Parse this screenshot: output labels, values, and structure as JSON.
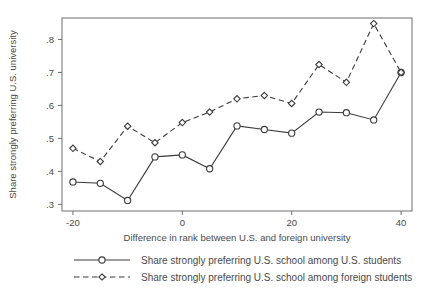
{
  "chart_data": {
    "type": "line",
    "title": "",
    "xlabel": "Difference in rank between U.S. and foreign university",
    "ylabel": "Share strongly preferring U.S. university",
    "xlim": [
      -22,
      42
    ],
    "ylim": [
      0.28,
      0.865
    ],
    "x": [
      -20,
      -15,
      -10,
      -5,
      0,
      5,
      10,
      15,
      20,
      25,
      30,
      35,
      40
    ],
    "xticks": [
      -20,
      0,
      20,
      40
    ],
    "xticklabels": [
      "-20",
      "0",
      "20",
      "40"
    ],
    "yticks": [
      0.3,
      0.4,
      0.5,
      0.6,
      0.7,
      0.8
    ],
    "yticklabels": [
      ".3",
      ".4",
      ".5",
      ".6",
      ".7",
      ".8"
    ],
    "grid": false,
    "legend_position": "below",
    "series": [
      {
        "name": "Share strongly preferring U.S. school among U.S. students",
        "marker": "circle",
        "linestyle": "solid",
        "color": "#3a3a3a",
        "values": [
          0.368,
          0.364,
          0.312,
          0.444,
          0.45,
          0.408,
          0.538,
          0.527,
          0.516,
          0.58,
          0.578,
          0.556,
          0.7
        ]
      },
      {
        "name": "Share strongly preferring U.S. school among foreign students",
        "marker": "diamond",
        "linestyle": "dashed",
        "color": "#3a3a3a",
        "values": [
          0.47,
          0.43,
          0.537,
          0.487,
          0.548,
          0.58,
          0.62,
          0.63,
          0.606,
          0.724,
          0.67,
          0.848,
          0.7
        ]
      }
    ]
  },
  "legend": {
    "entries": [
      {
        "label": "Share strongly preferring U.S. school among U.S. students",
        "style": "solid-circle"
      },
      {
        "label": "Share strongly preferring U.S. school among foreign students",
        "style": "dashed-diamond"
      }
    ]
  },
  "axes": {
    "x_title": "Difference in rank between U.S. and foreign university",
    "y_title": "Share strongly preferring U.S. university"
  }
}
